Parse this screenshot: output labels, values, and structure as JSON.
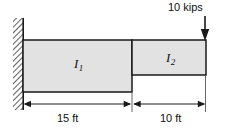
{
  "figure": {
    "type": "structural-beam-diagram",
    "background_color": "#ffffff",
    "line_color": "#1a1a1a",
    "beam_fill_color": "#e2e2e2"
  },
  "support": {
    "kind": "fixed-support",
    "hatch_label": "wall-hatching"
  },
  "load": {
    "label": "10 kips",
    "magnitude": 10,
    "unit": "kips",
    "direction": "down",
    "applied_at": "free end, top right"
  },
  "segments": [
    {
      "name": "segment-1",
      "inertia_symbol": "I",
      "inertia_subscript": "1",
      "length_label": "15 ft",
      "length_value": 15,
      "length_unit": "ft",
      "depth": "deeper"
    },
    {
      "name": "segment-2",
      "inertia_symbol": "I",
      "inertia_subscript": "2",
      "length_label": "10 ft",
      "length_value": 10,
      "length_unit": "ft",
      "depth": "shallower"
    }
  ],
  "dimensions": [
    {
      "label": "15 ft"
    },
    {
      "label": "10 ft"
    }
  ]
}
